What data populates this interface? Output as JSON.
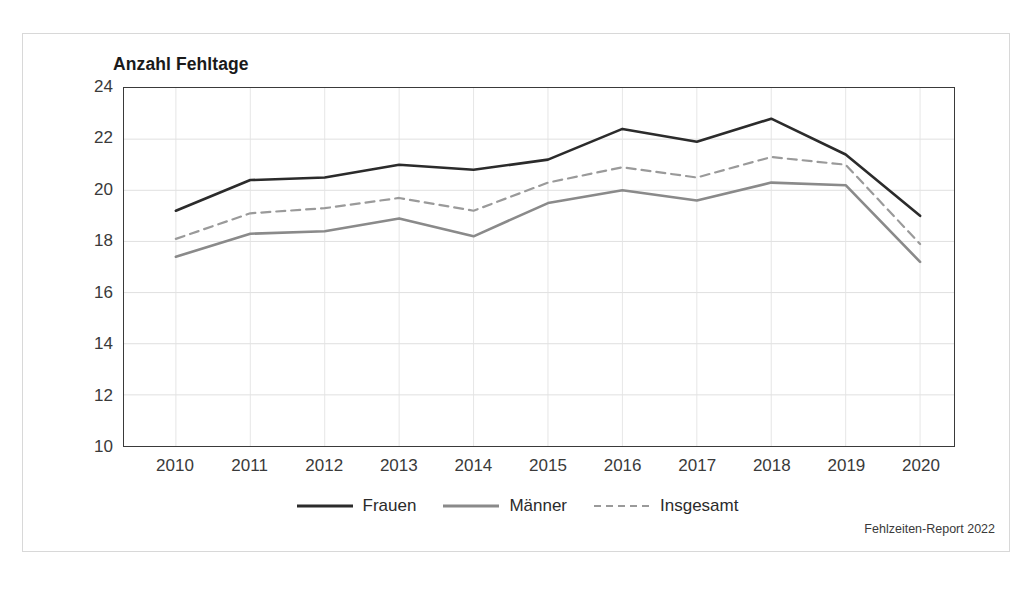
{
  "chart_data": {
    "type": "line",
    "title": "Anzahl Fehltage",
    "xlabel": "",
    "ylabel": "Anzahl Fehltage",
    "categories": [
      "2010",
      "2011",
      "2012",
      "2013",
      "2014",
      "2015",
      "2016",
      "2017",
      "2018",
      "2019",
      "2020"
    ],
    "x": [
      2010,
      2011,
      2012,
      2013,
      2014,
      2015,
      2016,
      2017,
      2018,
      2019,
      2020
    ],
    "ylim": [
      10,
      24
    ],
    "yticks": [
      10,
      12,
      14,
      16,
      18,
      20,
      22,
      24
    ],
    "grid": true,
    "legend_position": "bottom",
    "series": [
      {
        "name": "Frauen",
        "style": "solid",
        "color": "#2b2b2b",
        "values": [
          19.2,
          20.4,
          20.5,
          21.0,
          20.8,
          21.2,
          22.4,
          21.9,
          22.8,
          21.4,
          19.0
        ]
      },
      {
        "name": "Männer",
        "style": "solid",
        "color": "#8a8a8a",
        "values": [
          17.4,
          18.3,
          18.4,
          18.9,
          18.2,
          19.5,
          20.0,
          19.6,
          20.3,
          20.2,
          17.2
        ]
      },
      {
        "name": "Insgesamt",
        "style": "dashed",
        "color": "#9a9a9a",
        "values": [
          18.1,
          19.1,
          19.3,
          19.7,
          19.2,
          20.3,
          20.9,
          20.5,
          21.3,
          21.0,
          17.9
        ]
      }
    ],
    "source_note": "Fehlzeiten-Report 2022"
  },
  "legend": {
    "items": [
      {
        "label": "Frauen"
      },
      {
        "label": "Männer"
      },
      {
        "label": "Insgesamt"
      }
    ]
  }
}
